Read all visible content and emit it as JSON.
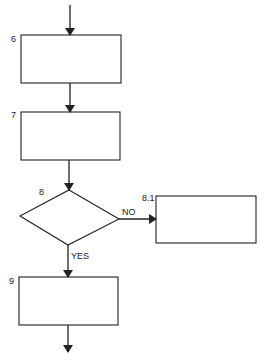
{
  "diagram": {
    "type": "flowchart",
    "nodes": [
      {
        "id": "6",
        "label": "6",
        "shape": "process",
        "text": ""
      },
      {
        "id": "7",
        "label": "7",
        "shape": "process",
        "text": ""
      },
      {
        "id": "8",
        "label": "8",
        "shape": "decision",
        "text": ""
      },
      {
        "id": "8.1",
        "label": "8.1",
        "shape": "process",
        "text": ""
      },
      {
        "id": "9",
        "label": "9",
        "shape": "process",
        "text": ""
      }
    ],
    "edges": [
      {
        "from": "entry",
        "to": "6",
        "label": ""
      },
      {
        "from": "6",
        "to": "7",
        "label": ""
      },
      {
        "from": "7",
        "to": "8",
        "label": ""
      },
      {
        "from": "8",
        "to": "8.1",
        "label": "NO"
      },
      {
        "from": "8",
        "to": "9",
        "label": "YES"
      },
      {
        "from": "9",
        "to": "exit",
        "label": ""
      }
    ],
    "colors": {
      "stroke": "#222222",
      "background": "#ffffff"
    }
  }
}
